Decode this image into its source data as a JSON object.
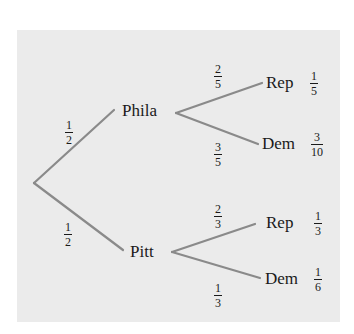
{
  "diagram": {
    "type": "probability-tree",
    "colors": {
      "background": "#ebebeb",
      "edge": "#8a8a8a",
      "text": "#1a1a1a"
    },
    "root": {
      "children": [
        {
          "label": "Phila",
          "edge_prob": {
            "num": "1",
            "den": "2"
          },
          "children": [
            {
              "label": "Rep",
              "edge_prob": {
                "num": "2",
                "den": "5"
              },
              "joint_prob": {
                "num": "1",
                "den": "5"
              }
            },
            {
              "label": "Dem",
              "edge_prob": {
                "num": "3",
                "den": "5"
              },
              "joint_prob": {
                "num": "3",
                "den": "10"
              }
            }
          ]
        },
        {
          "label": "Pitt",
          "edge_prob": {
            "num": "1",
            "den": "2"
          },
          "children": [
            {
              "label": "Rep",
              "edge_prob": {
                "num": "2",
                "den": "3"
              },
              "joint_prob": {
                "num": "1",
                "den": "3"
              }
            },
            {
              "label": "Dem",
              "edge_prob": {
                "num": "1",
                "den": "3"
              },
              "joint_prob": {
                "num": "1",
                "den": "6"
              }
            }
          ]
        }
      ]
    }
  }
}
